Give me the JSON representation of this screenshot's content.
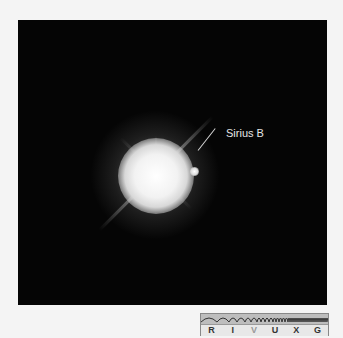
{
  "image": {
    "subject": "Sirius A with companion Sirius B",
    "annotation_label": "Sirius B",
    "background_color": "#050505"
  },
  "spectrum_bar": {
    "bands": [
      "R",
      "I",
      "V",
      "U",
      "X",
      "G"
    ],
    "highlighted_band": "V"
  }
}
